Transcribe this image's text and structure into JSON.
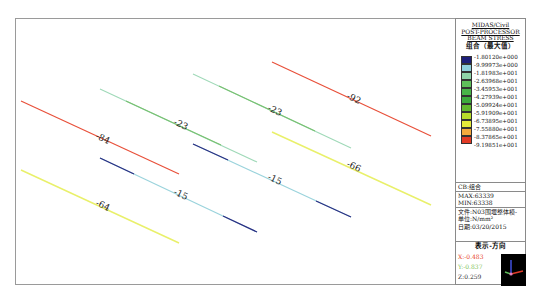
{
  "legend": {
    "program": "MIDAS/Civil",
    "module": "POST-PROCESSOR",
    "result_type": "BEAM STRESS",
    "combination_title": "组合（最大值）",
    "colorbar": [
      {
        "value": "-1.80120e+000",
        "color": "#1d1f7a"
      },
      {
        "value": "-9.99973e+000",
        "color": "#8fd0dc"
      },
      {
        "value": "-1.81983e+001",
        "color": "#8fd4a8"
      },
      {
        "value": "-2.63968e+001",
        "color": "#5fbf5a"
      },
      {
        "value": "-3.45953e+001",
        "color": "#48b548"
      },
      {
        "value": "-4.27939e+001",
        "color": "#3cab3c"
      },
      {
        "value": "-5.09924e+001",
        "color": "#62b92e"
      },
      {
        "value": "-5.91909e+001",
        "color": "#b7dc2a"
      },
      {
        "value": "-6.73895e+001",
        "color": "#e4ea3a"
      },
      {
        "value": "-7.55880e+001",
        "color": "#f3a93d"
      },
      {
        "value": "-8.37865e+001",
        "color": "#ee6a2f"
      },
      {
        "value": "-9.19851e+001",
        "color": "#e23a25"
      }
    ],
    "info": {
      "cb": "CB:组合",
      "max": "MAX:63339",
      "min": "MIN:63338",
      "file": "文件:N03围堰整体模-",
      "unit": "单位:N/mm²",
      "date": "日期:03/20/2015"
    },
    "direction": {
      "title": "表示-方向",
      "x": "X:-0.483",
      "y": "Y:-0.837",
      "z": "Z:0.259",
      "x_color": "#e8452c",
      "y_color": "#7fbf5a",
      "z_color": "#333333"
    }
  },
  "members": [
    {
      "label": "-84",
      "color": "#e8503a"
    },
    {
      "label": "-64",
      "color": "#e6ef5a"
    },
    {
      "label": "-23",
      "color": "#7cc88a"
    },
    {
      "label": "-15",
      "color": "#8fd0dc"
    },
    {
      "label": "-23",
      "color": "#7cc88a"
    },
    {
      "label": "-15",
      "color": "#8fd0dc"
    },
    {
      "label": "-92",
      "color": "#e8503a"
    },
    {
      "label": "-66",
      "color": "#e6ef5a"
    }
  ]
}
